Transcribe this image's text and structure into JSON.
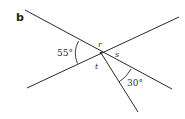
{
  "figure": {
    "part_label": "b",
    "angles": {
      "given_left": "55°",
      "given_lower_right": "30°"
    },
    "unknowns": {
      "r": "r",
      "s": "s",
      "t": "t"
    },
    "colors": {
      "line": "#2a2a2a",
      "text": "#333333",
      "background": "#ffffff"
    }
  }
}
